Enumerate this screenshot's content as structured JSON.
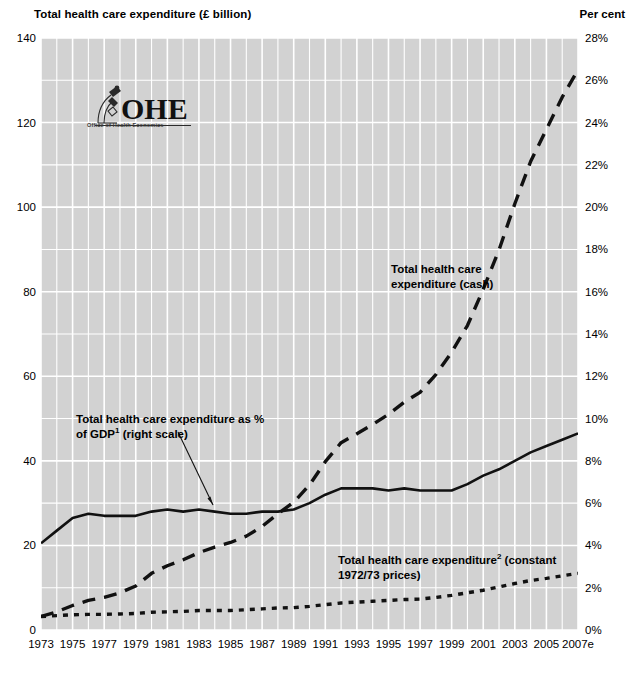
{
  "header": {
    "left_axis_title": "Total health care expenditure (£ billion)",
    "right_axis_title": "Per cent"
  },
  "logo": {
    "mark_name": "ohe-microscope-logo",
    "wordmark": "OHE",
    "tagline": "Office of Health Economics"
  },
  "annotations": [
    {
      "name": "annotation-cash",
      "line1": "Total health care",
      "line2": "expenditure (cash)",
      "x": 391,
      "y": 262
    },
    {
      "name": "annotation-gdp-share",
      "line1_a": "Total health care expenditure as  %",
      "line2_a": "of GDP",
      "line2_sup": "1",
      "line2_b": " (right scale)",
      "x": 76,
      "y": 412
    },
    {
      "name": "annotation-constant-prices",
      "line1_a": "Total health care expenditure",
      "line1_sup": "2",
      "line1_b": " (constant",
      "line2": "1972/73 prices)",
      "x": 338,
      "y": 553
    }
  ],
  "colors": {
    "plot_background": "#d2d2d2",
    "gridline": "#ffffff",
    "series_line": "#111111",
    "page_background": "#ffffff",
    "text": "#000000"
  },
  "chart_data": {
    "type": "line",
    "title": "Total health care expenditure (£ billion)",
    "xlabel": "",
    "ylabel": "Total health care expenditure (£ billion)",
    "y2label": "Per cent",
    "ylim": [
      0,
      140
    ],
    "y2lim": [
      0,
      28
    ],
    "yticks": [
      0,
      20,
      40,
      60,
      80,
      100,
      120,
      140
    ],
    "ytick_labels": [
      "0",
      "20",
      "40",
      "60",
      "80",
      "100",
      "120",
      "140"
    ],
    "y2ticks": [
      0,
      2,
      4,
      6,
      8,
      10,
      12,
      14,
      16,
      18,
      20,
      22,
      24,
      26,
      28
    ],
    "y2tick_labels": [
      "0%",
      "2%",
      "4%",
      "6%",
      "8%",
      "10%",
      "12%",
      "14%",
      "16%",
      "18%",
      "20%",
      "22%",
      "24%",
      "26%",
      "28%"
    ],
    "y_minor_step": 10,
    "grid": true,
    "grid_color": "#ffffff",
    "legend": "annotations-inline",
    "x": [
      1973,
      1974,
      1975,
      1976,
      1977,
      1978,
      1979,
      1980,
      1981,
      1982,
      1983,
      1984,
      1985,
      1986,
      1987,
      1988,
      1989,
      1990,
      1991,
      1992,
      1993,
      1994,
      1995,
      1996,
      1997,
      1998,
      1999,
      2000,
      2001,
      2002,
      2003,
      2004,
      2005,
      2006,
      2007
    ],
    "xtick_labels": [
      "1973",
      "1975",
      "1977",
      "1979",
      "1981",
      "1983",
      "1985",
      "1987",
      "1989",
      "1991",
      "1993",
      "1995",
      "1997",
      "1999",
      "2001",
      "2003",
      "2005",
      "2007e"
    ],
    "xtick_step_years": 2,
    "series": [
      {
        "name": "Total health care expenditure (cash)",
        "axis": "left",
        "style": "dashed",
        "units": "£ billion",
        "values": [
          3.2,
          4.3,
          5.8,
          7.0,
          7.7,
          8.8,
          10.4,
          13.4,
          15.2,
          16.6,
          18.3,
          19.6,
          20.7,
          22.2,
          24.5,
          27.5,
          30.2,
          34.3,
          39.8,
          44.3,
          46.4,
          48.6,
          51.0,
          53.9,
          56.2,
          60.4,
          65.7,
          72.0,
          80.6,
          89.9,
          100.8,
          110.8,
          118.4,
          126.0,
          132.5
        ]
      },
      {
        "name": "Total health care expenditure as % of GDP (right scale)",
        "axis": "right",
        "style": "solid",
        "units": "per cent of GDP",
        "values": [
          4.1,
          4.7,
          5.3,
          5.5,
          5.4,
          5.4,
          5.4,
          5.6,
          5.7,
          5.6,
          5.7,
          5.6,
          5.5,
          5.5,
          5.6,
          5.6,
          5.7,
          6.0,
          6.4,
          6.7,
          6.7,
          6.7,
          6.6,
          6.7,
          6.6,
          6.6,
          6.6,
          6.9,
          7.3,
          7.6,
          8.0,
          8.4,
          8.7,
          9.0,
          9.3
        ]
      },
      {
        "name": "Total health care expenditure (constant 1972/73 prices)",
        "axis": "left",
        "style": "dotted",
        "units": "£ billion, 1972/73 prices",
        "values": [
          3.2,
          3.4,
          3.6,
          3.7,
          3.7,
          3.8,
          3.9,
          4.2,
          4.3,
          4.4,
          4.6,
          4.6,
          4.6,
          4.8,
          5.0,
          5.2,
          5.3,
          5.6,
          6.0,
          6.4,
          6.6,
          6.8,
          7.0,
          7.2,
          7.3,
          7.7,
          8.2,
          8.8,
          9.4,
          10.2,
          11.0,
          11.7,
          12.2,
          12.8,
          13.4
        ]
      }
    ]
  }
}
